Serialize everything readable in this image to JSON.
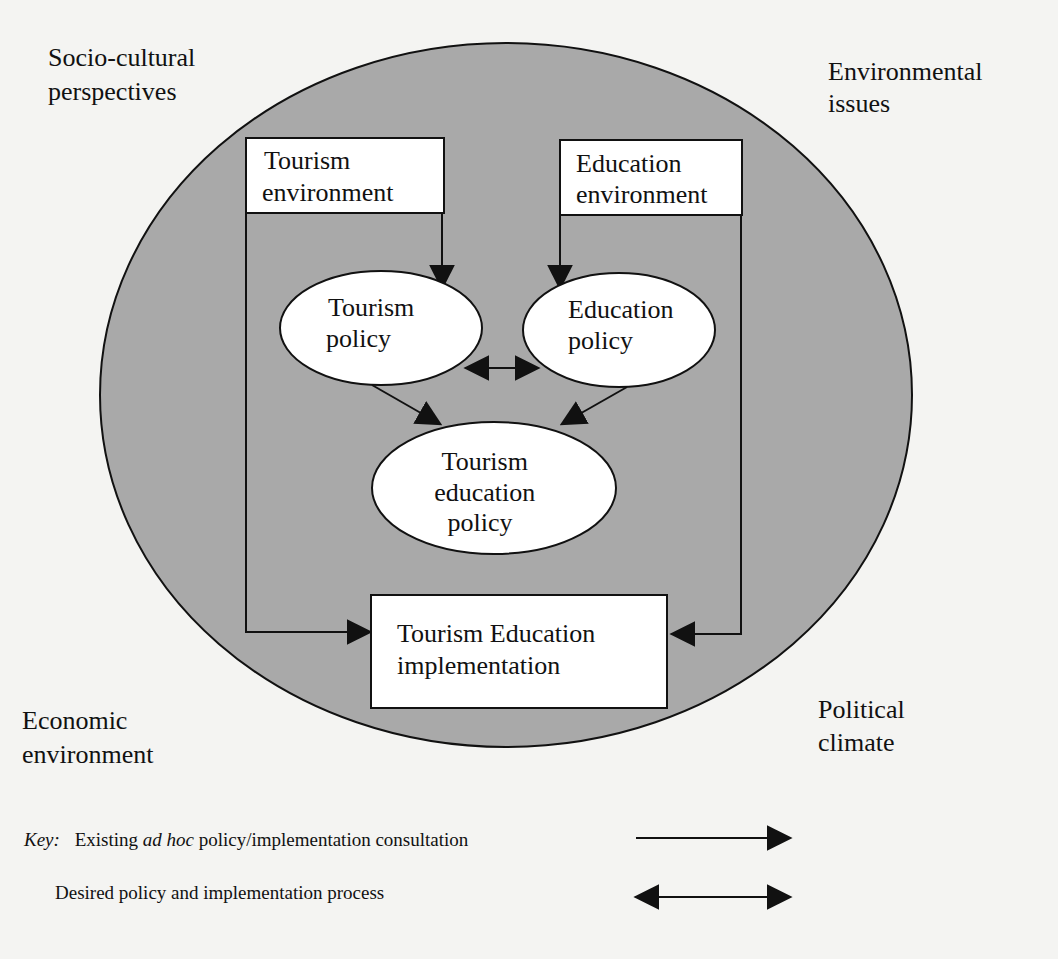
{
  "corners": {
    "top_left": [
      "Socio-cultural",
      "perspectives"
    ],
    "top_right": [
      "Environmental",
      "issues"
    ],
    "bottom_left": [
      "Economic",
      "environment"
    ],
    "bottom_right": [
      "Political",
      "climate"
    ]
  },
  "nodes": {
    "tourism_environment": [
      "Tourism",
      "environment"
    ],
    "education_environment": [
      "Education",
      "environment"
    ],
    "tourism_policy": [
      "Tourism",
      "policy"
    ],
    "education_policy": [
      "Education",
      "policy"
    ],
    "tourism_education_policy": [
      "Tourism",
      "education",
      "policy"
    ],
    "implementation": [
      "Tourism Education",
      "implementation"
    ]
  },
  "key": {
    "label": "Key:",
    "existing_pre": "Existing ",
    "existing_italic": "ad hoc",
    "existing_post": " policy/implementation consultation",
    "desired": "Desired policy and implementation process"
  },
  "colors": {
    "circle_fill": "#a9a9a9",
    "background": "#f4f4f2",
    "stroke": "#111111"
  }
}
